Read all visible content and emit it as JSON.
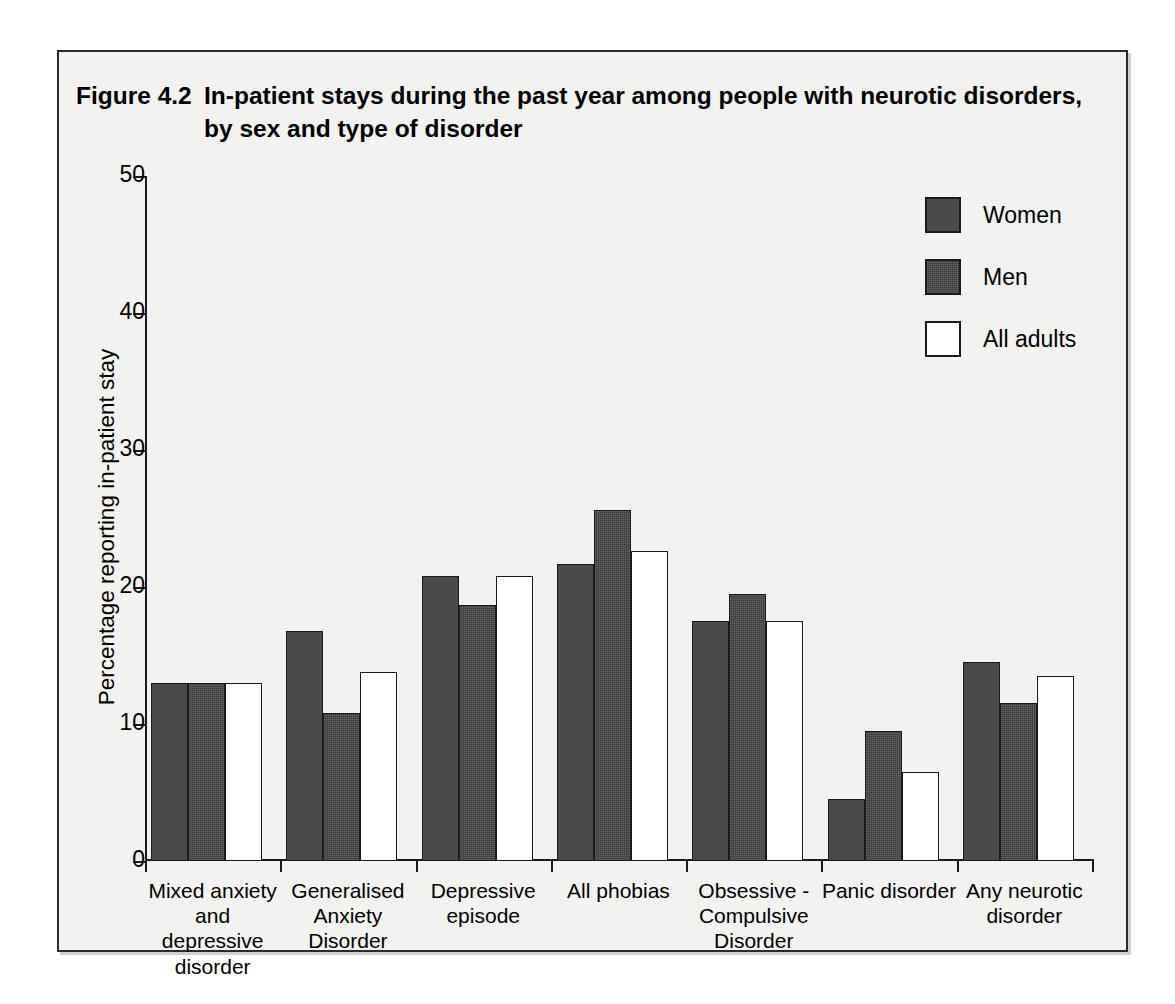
{
  "figure": {
    "number_label": "Figure 4.2",
    "title_line1": "In-patient stays during the past year among people with neurotic disorders,",
    "title_line2": "by sex and type of disorder"
  },
  "legend": {
    "position": "top-right",
    "entries": [
      {
        "label": "Women",
        "color": "#4a4a4a",
        "swatch": "women"
      },
      {
        "label": "Men",
        "color": "#3a3a3a",
        "swatch": "men"
      },
      {
        "label": "All adults",
        "color": "#ffffff",
        "swatch": "all"
      }
    ]
  },
  "chart_data": {
    "type": "bar",
    "xlabel": "",
    "ylabel": "Percentage reporting in-patient stay",
    "ylim": [
      0,
      50
    ],
    "yticks": [
      0,
      10,
      20,
      30,
      40,
      50
    ],
    "ytick_labels": [
      "0",
      "10",
      "20",
      "30",
      "40",
      "50"
    ],
    "grid": false,
    "legend_position": "top-right",
    "categories": [
      "Mixed anxiety\nand depressive\ndisorder",
      "Generalised\nAnxiety Disorder",
      "Depressive\nepisode",
      "All phobias",
      "Obsessive -\nCompulsive\nDisorder",
      "Panic disorder",
      "Any neurotic\ndisorder"
    ],
    "category_lines": [
      [
        "Mixed anxiety",
        "and depressive",
        "disorder"
      ],
      [
        "Generalised",
        "Anxiety Disorder"
      ],
      [
        "Depressive",
        "episode"
      ],
      [
        "All phobias"
      ],
      [
        "Obsessive -",
        "Compulsive",
        "Disorder"
      ],
      [
        "Panic disorder"
      ],
      [
        "Any neurotic",
        "disorder"
      ]
    ],
    "series": [
      {
        "name": "Women",
        "color": "#4a4a4a",
        "values": [
          13.0,
          16.8,
          20.8,
          21.7,
          17.5,
          4.5,
          14.5
        ]
      },
      {
        "name": "Men",
        "color": "#3a3a3a",
        "values": [
          13.0,
          10.8,
          18.7,
          25.6,
          19.5,
          9.5,
          11.5
        ]
      },
      {
        "name": "All adults",
        "color": "#ffffff",
        "values": [
          13.0,
          13.8,
          20.8,
          22.6,
          17.5,
          6.5,
          13.5
        ]
      }
    ]
  }
}
